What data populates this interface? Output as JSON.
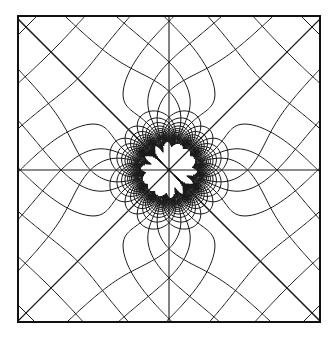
{
  "figure": {
    "canvas": {
      "width": 335,
      "height": 339
    },
    "frame": {
      "x0": 18,
      "y0": 16,
      "x1": 320,
      "y1": 322,
      "stroke": "#111111",
      "stroke_width": 2
    },
    "center": {
      "x": 169,
      "y": 170
    },
    "line_color": "#1a1a1a",
    "line_width": 1.0,
    "background": "#ffffff",
    "axes_lines": [
      "horizontal",
      "vertical",
      "diagonal",
      "anti-diagonal"
    ],
    "potential": {
      "form": "F(z) = zr + a^4 / zr^3, zr = z * exp(i*pi/4)",
      "a": 62,
      "scale_px": 1,
      "level_spacing": 34,
      "level_count": 14
    }
  }
}
